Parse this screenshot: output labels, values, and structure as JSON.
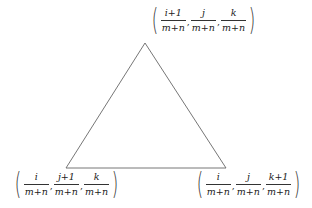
{
  "diagram": {
    "type": "triangle",
    "stroke_color": "#666666",
    "vertices": {
      "top": {
        "x": 145,
        "y": 43
      },
      "bottom_left": {
        "x": 66,
        "y": 168
      },
      "bottom_right": {
        "x": 226,
        "y": 168
      }
    },
    "labels": {
      "top": {
        "open": "(",
        "close": ")",
        "coords": [
          {
            "num": "i+1",
            "den": "m+n"
          },
          {
            "num": "j",
            "den": "m+n"
          },
          {
            "num": "k",
            "den": "m+n"
          }
        ],
        "sep": ","
      },
      "bottom_left": {
        "open": "(",
        "close": ")",
        "coords": [
          {
            "num": "i",
            "den": "m+n"
          },
          {
            "num": "j+1",
            "den": "m+n"
          },
          {
            "num": "k",
            "den": "m+n"
          }
        ],
        "sep": ","
      },
      "bottom_right": {
        "open": "(",
        "close": ")",
        "coords": [
          {
            "num": "i",
            "den": "m+n"
          },
          {
            "num": "j",
            "den": "m+n"
          },
          {
            "num": "k+1",
            "den": "m+n"
          }
        ],
        "sep": ","
      }
    }
  }
}
